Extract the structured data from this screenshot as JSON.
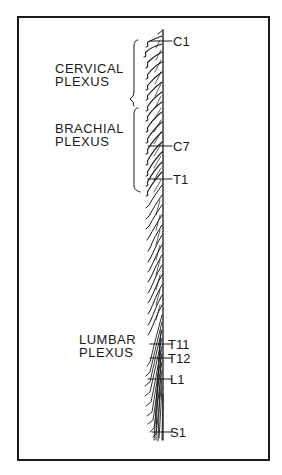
{
  "figure": {
    "plexuses": [
      {
        "line1": "CERVICAL",
        "line2": "PLEXUS"
      },
      {
        "line1": "BRACHIAL",
        "line2": "PLEXUS"
      },
      {
        "line1": "LUMBAR",
        "line2": "PLEXUS"
      }
    ],
    "segments": [
      {
        "label": "C1"
      },
      {
        "label": "C7"
      },
      {
        "label": "T1"
      },
      {
        "label": "T11"
      },
      {
        "label": "T12"
      },
      {
        "label": "L1"
      },
      {
        "label": "S1"
      }
    ],
    "colors": {
      "ink": "#1a1a1a",
      "background": "#ffffff"
    }
  }
}
